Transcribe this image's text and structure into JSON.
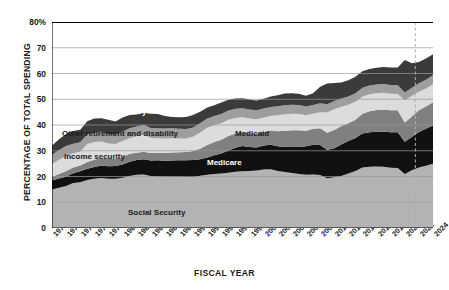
{
  "chart_data": {
    "type": "area",
    "title": "",
    "xlabel": "FISCAL YEAR",
    "ylabel": "PERCENTAGE OF TOTAL SPENDING",
    "ylim": [
      0,
      80
    ],
    "yticks": [
      0,
      10,
      20,
      30,
      40,
      50,
      60,
      70,
      80
    ],
    "ytick_labels": [
      "0",
      "10",
      "20",
      "30",
      "40",
      "50",
      "60",
      "70",
      "80%"
    ],
    "grid": true,
    "legend_position": "inline-labels",
    "stacked": true,
    "x": [
      1970,
      1971,
      1972,
      1973,
      1974,
      1975,
      1976,
      1977,
      1978,
      1979,
      1980,
      1981,
      1982,
      1983,
      1984,
      1985,
      1986,
      1987,
      1988,
      1989,
      1990,
      1991,
      1992,
      1993,
      1994,
      1995,
      1996,
      1997,
      1998,
      1999,
      2000,
      2001,
      2002,
      2003,
      2004,
      2005,
      2006,
      2007,
      2008,
      2009,
      2010,
      2011,
      2012,
      2013,
      2014,
      2015,
      2016,
      2017,
      2018,
      2019,
      2020,
      2021,
      2022,
      2023,
      2024
    ],
    "xtick_labels": [
      "1970",
      "1972",
      "1974",
      "1976",
      "1978",
      "1980",
      "1982",
      "1984",
      "1986",
      "1988",
      "1990",
      "1992",
      "1994",
      "1996",
      "1998",
      "2000",
      "2002",
      "2004",
      "2006",
      "2008",
      "2010",
      "2012",
      "2014",
      "2016",
      "2018",
      "2020",
      "2022",
      "2024"
    ],
    "annotation_line": {
      "label": "projection-divider",
      "x": 2021.5,
      "style": "dashed"
    },
    "series": [
      {
        "name": "Social Security",
        "color": "#b3b3b3",
        "label_color": "dark",
        "values": [
          15.0,
          15.6,
          16.3,
          17.5,
          17.8,
          18.6,
          19.1,
          19.4,
          19.1,
          19.1,
          19.5,
          20.2,
          20.7,
          20.8,
          20.2,
          20.0,
          19.9,
          19.9,
          19.9,
          19.8,
          19.8,
          20.3,
          20.7,
          21.0,
          21.2,
          21.5,
          21.8,
          22.0,
          22.1,
          22.3,
          22.7,
          22.8,
          22.1,
          21.7,
          21.4,
          21.0,
          20.7,
          20.8,
          20.6,
          19.3,
          19.7,
          20.2,
          21.2,
          22.1,
          23.5,
          23.8,
          23.9,
          23.8,
          23.4,
          23.3,
          21.0,
          22.4,
          23.5,
          24.2,
          25.0
        ]
      },
      {
        "name": "Medicare",
        "color": "#111111",
        "label_color": "light",
        "values": [
          3.4,
          3.6,
          3.7,
          3.8,
          4.2,
          4.4,
          4.6,
          4.9,
          4.9,
          5.0,
          5.2,
          5.5,
          5.7,
          5.9,
          6.0,
          6.3,
          6.2,
          6.3,
          6.4,
          6.5,
          6.6,
          6.4,
          6.7,
          7.3,
          7.7,
          8.6,
          9.4,
          9.8,
          9.4,
          9.0,
          9.3,
          9.5,
          9.6,
          9.9,
          10.1,
          10.5,
          11.0,
          11.5,
          11.6,
          11.0,
          11.3,
          12.2,
          12.6,
          12.9,
          13.2,
          13.4,
          13.5,
          13.7,
          13.8,
          13.9,
          12.5,
          12.9,
          13.8,
          14.3,
          14.8
        ]
      },
      {
        "name": "Medicaid",
        "color": "#808080",
        "label_color": "dark",
        "values": [
          1.5,
          1.8,
          2.1,
          2.2,
          2.3,
          2.6,
          2.8,
          2.9,
          2.8,
          2.8,
          2.9,
          3.1,
          2.8,
          2.9,
          2.9,
          2.9,
          3.0,
          3.1,
          3.1,
          3.2,
          3.5,
          4.1,
          4.8,
          5.1,
          5.4,
          5.6,
          5.5,
          5.4,
          5.3,
          5.3,
          5.4,
          5.6,
          5.9,
          6.2,
          6.5,
          6.5,
          6.1,
          6.2,
          6.5,
          6.7,
          7.1,
          7.2,
          6.9,
          7.0,
          7.7,
          8.1,
          8.4,
          8.5,
          8.5,
          8.5,
          7.5,
          8.0,
          8.4,
          8.7,
          9.0
        ]
      },
      {
        "name": "Income security",
        "color": "#dcdcdc",
        "label_color": "dark",
        "values": [
          4.9,
          5.5,
          5.9,
          5.5,
          5.4,
          7.0,
          6.9,
          6.4,
          6.0,
          5.7,
          6.2,
          6.1,
          6.3,
          6.6,
          5.9,
          5.7,
          5.7,
          5.6,
          5.4,
          5.3,
          5.5,
          6.3,
          6.7,
          6.5,
          6.4,
          6.3,
          6.0,
          5.8,
          5.7,
          5.6,
          5.5,
          5.6,
          6.2,
          6.4,
          6.4,
          6.3,
          6.0,
          5.9,
          6.3,
          7.9,
          8.0,
          7.5,
          7.2,
          7.0,
          6.7,
          6.6,
          6.5,
          6.5,
          6.4,
          6.3,
          8.6,
          8.0,
          7.2,
          7.0,
          7.0
        ]
      },
      {
        "name": "Other retirement and disability",
        "color": "#9e9e9e",
        "label_color": "dark",
        "values": [
          3.6,
          3.8,
          3.8,
          3.7,
          3.6,
          3.8,
          3.8,
          3.8,
          3.7,
          3.6,
          3.7,
          3.8,
          3.9,
          3.9,
          3.8,
          3.8,
          3.8,
          3.8,
          3.7,
          3.6,
          3.6,
          3.6,
          3.6,
          3.6,
          3.6,
          3.6,
          3.6,
          3.5,
          3.5,
          3.5,
          3.5,
          3.5,
          3.5,
          3.5,
          3.5,
          3.5,
          3.4,
          3.4,
          3.4,
          3.2,
          3.2,
          3.2,
          3.2,
          3.3,
          3.4,
          3.4,
          3.4,
          3.4,
          3.4,
          3.4,
          3.0,
          3.2,
          3.3,
          3.4,
          3.5
        ]
      },
      {
        "name": "Other mandatory",
        "color": "#3b3b3b",
        "label_color": "light",
        "values": [
          3.6,
          4.2,
          4.7,
          5.0,
          4.9,
          5.1,
          5.3,
          5.2,
          5.5,
          5.2,
          5.4,
          5.2,
          4.7,
          4.7,
          5.6,
          5.6,
          4.9,
          4.4,
          4.5,
          4.7,
          4.9,
          4.4,
          4.3,
          4.2,
          4.4,
          4.2,
          4.0,
          3.9,
          3.9,
          3.8,
          3.8,
          4.1,
          4.3,
          4.5,
          4.4,
          4.3,
          4.2,
          4.5,
          6.5,
          8.0,
          7.0,
          6.2,
          6.3,
          6.4,
          6.4,
          6.4,
          6.5,
          6.6,
          6.8,
          6.9,
          12.6,
          9.5,
          8.3,
          8.2,
          8.2
        ]
      }
    ],
    "inline_labels": [
      {
        "text": "Other mandatory",
        "x_px": 82,
        "y_px": 107,
        "tone": "light",
        "name": "series-label-other-mandatory"
      },
      {
        "text": "Other retirement and disability",
        "x_px": 62,
        "y_px": 129,
        "tone": "dark",
        "name": "series-label-other-retirement"
      },
      {
        "text": "Income security",
        "x_px": 64,
        "y_px": 152,
        "tone": "dark",
        "name": "series-label-income-security"
      },
      {
        "text": "Medicaid",
        "x_px": 235,
        "y_px": 129,
        "tone": "dark",
        "name": "series-label-medicaid"
      },
      {
        "text": "Medicare",
        "x_px": 207,
        "y_px": 158,
        "tone": "light",
        "name": "series-label-medicare"
      },
      {
        "text": "Social Security",
        "x_px": 128,
        "y_px": 208,
        "tone": "dark",
        "name": "series-label-social-security"
      }
    ]
  },
  "axes": {
    "y_title": "PERCENTAGE OF TOTAL SPENDING",
    "x_title": "FISCAL YEAR"
  },
  "colors": {
    "social_security": "#b3b3b3",
    "medicare": "#111111",
    "medicaid": "#808080",
    "income_security": "#dcdcdc",
    "other_retirement": "#9e9e9e",
    "other_mandatory": "#3b3b3b",
    "grid": "#9a9a9a",
    "axis": "#000000",
    "divider": "#b0b0b0"
  }
}
